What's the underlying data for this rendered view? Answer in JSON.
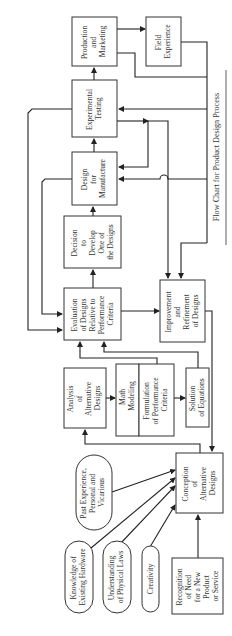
{
  "caption": "Flow Chart for Product Design Process",
  "boxes": {
    "production": [
      "Production",
      "and",
      "Marketing"
    ],
    "field": [
      "Field",
      "Experience"
    ],
    "testing": [
      "Experimental",
      "Testing"
    ],
    "manufacture": [
      "Design",
      "for",
      "Manufacture"
    ],
    "decision": [
      "Decision",
      "to",
      "Develop",
      "One of",
      "the Designs"
    ],
    "evaluation": [
      "Evaluation",
      "of Designs",
      "Relative to",
      "Performance",
      "Criteria"
    ],
    "improvement": [
      "Improvement",
      "and",
      "Refinement",
      "of Designs"
    ],
    "analysis": [
      "Analysis",
      "of",
      "Alternative",
      "Designs"
    ],
    "math": [
      "Math",
      "Modeling"
    ],
    "formulation": [
      "Formulation",
      "of Performance",
      "Criteria"
    ],
    "solution": [
      "Solution",
      "of Equations"
    ],
    "conception": [
      "Conception",
      "of",
      "Alternative",
      "Designs"
    ],
    "recognition": [
      "Recognition",
      "of Need",
      "for a New",
      "Product",
      "or Service"
    ]
  },
  "ovals": {
    "past": [
      "Past Experience,",
      "Personal and",
      "Vicarious"
    ],
    "knowledge": [
      "Knowledge of",
      "Existing Hardware"
    ],
    "understanding": [
      "Understanding",
      "of Physical Laws"
    ],
    "creativity": [
      "Creativity"
    ]
  }
}
